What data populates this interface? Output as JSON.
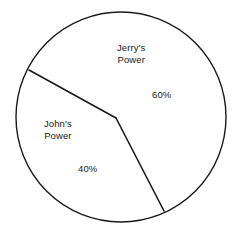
{
  "chart_data": {
    "type": "pie",
    "title": "",
    "categories": [
      "Jerry's Power",
      "John's Power"
    ],
    "values": [
      60,
      40
    ],
    "value_labels": [
      "60%",
      "40%"
    ],
    "unit": "%",
    "legend": "none",
    "grid": false,
    "slices": [
      {
        "name": "Jerry's Power",
        "label_line1": "Jerry's",
        "label_line2": "Power",
        "value": 60,
        "value_label": "60%",
        "fill": "#ffffff",
        "stroke": "#1a1a1a"
      },
      {
        "name": "John's Power",
        "label_line1": "John's",
        "label_line2": "Power",
        "value": 40,
        "value_label": "40%",
        "fill": "#ffffff",
        "stroke": "#1a1a1a"
      }
    ],
    "geometry": {
      "center_x": 121,
      "center_y": 117,
      "radius": 105,
      "divider_start_x": 29,
      "divider_start_y": 70,
      "divider_vertex_x": 116,
      "divider_vertex_y": 118,
      "divider_end_x": 164,
      "divider_end_y": 211,
      "stroke_width": 1.4
    },
    "colors": {
      "background": "#ffffff",
      "outline": "#1a1a1a",
      "text": "#1a1a1a"
    }
  }
}
